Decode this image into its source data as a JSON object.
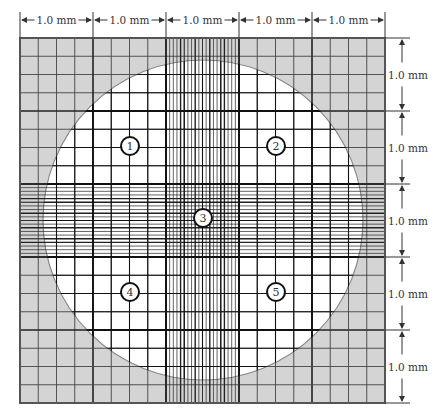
{
  "diagram": {
    "colors": {
      "background": "#ffffff",
      "shaded_area": "#d4d4d4",
      "grid_line": "#444444",
      "heavy_line": "#222222",
      "text": "#333333"
    },
    "grid": {
      "left": 20,
      "top": 38,
      "cell_mm_px": 73,
      "cols": 5,
      "rows": 5
    },
    "circle": {
      "cx": 203,
      "cy": 220,
      "r": 160
    },
    "top_dimensions": [
      {
        "label": "1.0 mm"
      },
      {
        "label": "1.0 mm"
      },
      {
        "label": "1.0 mm"
      },
      {
        "label": "1.0 mm"
      },
      {
        "label": "1.0 mm"
      }
    ],
    "right_dimensions": [
      {
        "label": "1.0 mm"
      },
      {
        "label": "1.0 mm"
      },
      {
        "label": "1.0 mm"
      },
      {
        "label": "1.0 mm"
      },
      {
        "label": "1.0 mm"
      }
    ],
    "counting_squares": [
      {
        "label": "1",
        "x": 130,
        "y": 146
      },
      {
        "label": "2",
        "x": 276,
        "y": 146
      },
      {
        "label": "3",
        "x": 203,
        "y": 218
      },
      {
        "label": "4",
        "x": 130,
        "y": 292
      },
      {
        "label": "5",
        "x": 276,
        "y": 292
      }
    ]
  }
}
